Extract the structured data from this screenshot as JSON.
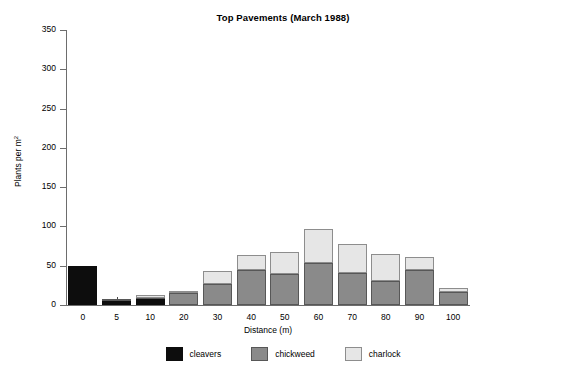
{
  "chart_data": {
    "type": "bar",
    "stacked": true,
    "title": "Top Pavements (March 1988)",
    "xlabel": "Distance (m)",
    "ylabel": "Plants per m",
    "ylabel_sup": "2",
    "categories": [
      "0",
      "5",
      "10",
      "20",
      "30",
      "40",
      "50",
      "60",
      "70",
      "80",
      "90",
      "100"
    ],
    "series": [
      {
        "name": "cleavers",
        "color": "#0d0d0d",
        "values": [
          50,
          5,
          8,
          0,
          0,
          0,
          0,
          0,
          0,
          0,
          0,
          0
        ]
      },
      {
        "name": "chickweed",
        "color": "#8a8a8a",
        "values": [
          0,
          1,
          1,
          15,
          27,
          44,
          40,
          53,
          41,
          31,
          44,
          17
        ]
      },
      {
        "name": "charlock",
        "color": "#e6e6e6",
        "values": [
          0,
          0,
          4,
          3,
          16,
          20,
          28,
          44,
          37,
          34,
          17,
          5
        ]
      }
    ],
    "totals": [
      50,
      6,
      13,
      18,
      43,
      64,
      68,
      97,
      78,
      65,
      61,
      22
    ],
    "yticks": [
      0,
      50,
      100,
      150,
      200,
      250,
      300,
      350
    ],
    "ylim": [
      0,
      350
    ],
    "grid": false,
    "legend_position": "bottom",
    "legend_entries": [
      "cleavers",
      "chickweed",
      "charlock"
    ]
  }
}
